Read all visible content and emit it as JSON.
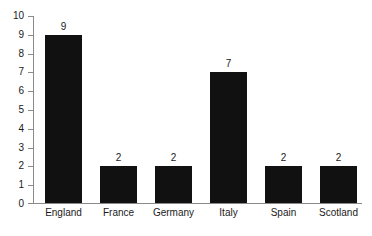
{
  "chart_data": {
    "type": "bar",
    "title": "",
    "subtitle": "",
    "xlabel": "",
    "ylabel": "",
    "categories": [
      "England",
      "France",
      "Germany",
      "Italy",
      "Spain",
      "Scotland"
    ],
    "values": [
      9,
      2,
      2,
      7,
      2,
      2
    ],
    "value_labels": [
      "9",
      "2",
      "2",
      "7",
      "2",
      "2"
    ],
    "ylim": [
      0,
      10
    ],
    "ytick_labels": [
      "10",
      "9",
      "8",
      "7",
      "6",
      "5",
      "4",
      "3",
      "2",
      "1",
      "0"
    ],
    "ytick_values": [
      10,
      9,
      8,
      7,
      6,
      5,
      4,
      3,
      2,
      1,
      0
    ],
    "grid": false,
    "legend": null,
    "annotations": [],
    "colors": {
      "bar": "#111111",
      "axis": "#8a8a8a",
      "text": "#1a1a1a",
      "background": "#ffffff"
    }
  }
}
